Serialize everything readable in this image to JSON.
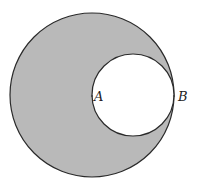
{
  "diagram": {
    "type": "geometry",
    "colors": {
      "shade": "#b9b9b9",
      "stroke": "#2a2a2a",
      "inner_fill": "#ffffff"
    },
    "large_circle": {
      "cx": 92,
      "cy": 95,
      "r": 82
    },
    "small_circle": {
      "cx": 133,
      "cy": 95,
      "r": 41
    },
    "points": [
      {
        "id": "A",
        "label": "A",
        "x": 92,
        "y": 96
      },
      {
        "id": "B",
        "label": "B",
        "x": 174,
        "y": 96
      }
    ]
  }
}
